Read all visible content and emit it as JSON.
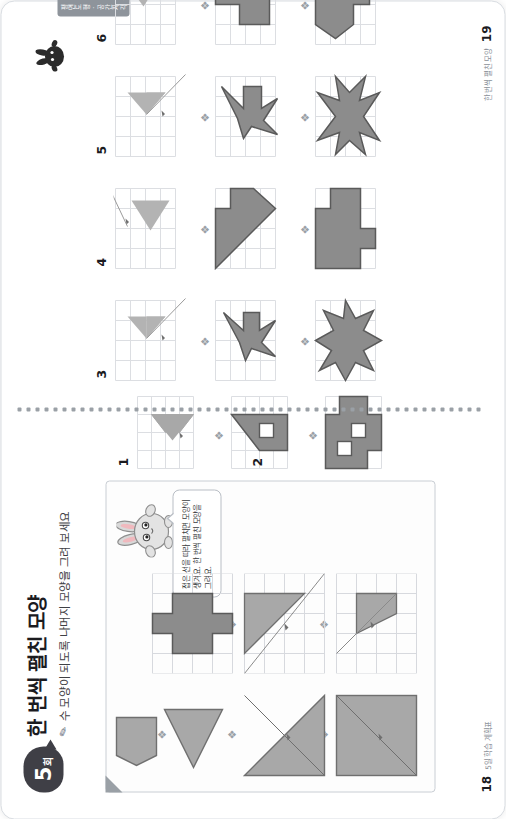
{
  "worksheet": {
    "badge_number": "5",
    "badge_unit": "회",
    "title": "한 번씩 펼친 모양",
    "subtitle": "수 모양이 되도록 나머지 모양을 그려 보세요",
    "pencil_icon": "pencil-icon"
  },
  "speech_bubble": {
    "text": "접은 선을 따라 펼치면 모양이 생겨요. 한 번씩 펼친 모양을 그려요."
  },
  "example": {
    "label": "example-card",
    "steps": [
      {
        "name": "square-with-diagonal",
        "arrow": "arrow-up"
      },
      {
        "name": "triangle-with-diagonal",
        "arrow": "arrow-up"
      },
      {
        "name": "left-triangle",
        "arrow": "arrow-up"
      },
      {
        "name": "pentagon-arrow",
        "arrow": "arrow-up"
      }
    ],
    "results": [
      {
        "name": "grid-diagonal-fold",
        "arrow": "arrow-up"
      },
      {
        "name": "grid-half-fold",
        "arrow": "arrow-up"
      },
      {
        "name": "plus-cross-shape",
        "arrow": "arrow-up"
      }
    ]
  },
  "problems": [
    {
      "number": "1",
      "name": "problem-1",
      "page": "18"
    },
    {
      "number": "2",
      "name": "problem-2",
      "page": "18"
    },
    {
      "number": "3",
      "name": "problem-3",
      "page": "19"
    },
    {
      "number": "4",
      "name": "problem-4",
      "page": "19"
    },
    {
      "number": "5",
      "name": "problem-5",
      "page": "19"
    },
    {
      "number": "6",
      "name": "problem-6",
      "page": "19"
    }
  ],
  "footer": {
    "left_page": "18",
    "left_text": "5일 학습 계획표",
    "right_page": "19",
    "right_text": "한 번씩 펼친 모양"
  },
  "side_tab": {
    "label": "평면도형 · 공간지각"
  },
  "colors": {
    "shape_fill": "#8c8c8c",
    "shape_stroke": "#5a5a5a",
    "shape_fill_light": "#a8a8a8",
    "grid_line": "#d7d9de",
    "page_border": "#d9dde2",
    "badge_bg": "#3f3f46",
    "arrow": "#9aa0a6",
    "tab_bg": "#8e949b"
  }
}
